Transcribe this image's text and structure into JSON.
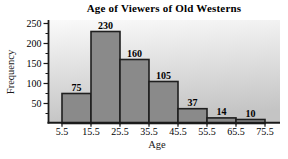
{
  "chart_data": {
    "type": "bar",
    "subtype": "histogram",
    "title": "Age of Viewers of Old Westerns",
    "xlabel": "Age",
    "ylabel": "Frequency",
    "bin_edges": [
      5.5,
      15.5,
      25.5,
      35.5,
      45.5,
      55.5,
      65.5,
      75.5
    ],
    "values": [
      75,
      230,
      160,
      105,
      37,
      14,
      10
    ],
    "bar_labels": [
      "75",
      "230",
      "160",
      "105",
      "37",
      "14",
      "10"
    ],
    "x_tick_labels": [
      "5.5",
      "15.5",
      "25.5",
      "35.5",
      "45.5",
      "55.5",
      "65.5",
      "75.5"
    ],
    "y_tick_labels": [
      "50",
      "100",
      "150",
      "200",
      "250"
    ],
    "y_ticks": [
      50,
      100,
      150,
      200,
      250
    ],
    "y_minor_ticks": [
      25,
      75,
      125,
      175,
      225
    ],
    "ylim": [
      0,
      258
    ],
    "grid": false,
    "legend": null,
    "colors": {
      "bar_fill": "#8a8a8a",
      "bar_border": "#1f1f1f",
      "plot_bg_top": "#fafafa",
      "plot_bg_bottom": "#c4c4c4",
      "axis": "#1a1a1a",
      "text": "#000000"
    }
  }
}
